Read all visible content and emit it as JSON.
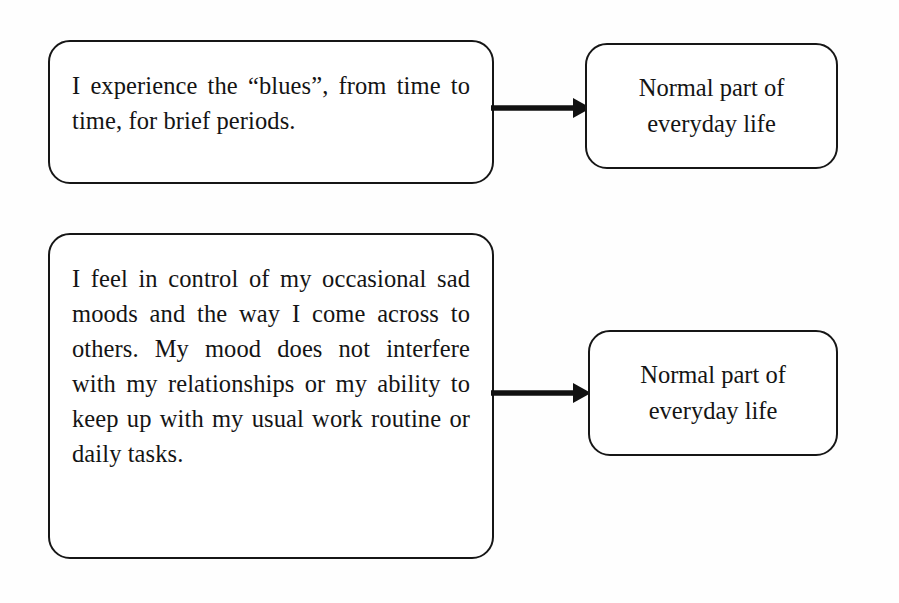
{
  "diagram": {
    "type": "flowchart",
    "background_color": "#fefefe",
    "stroke_color": "#161616",
    "rows": [
      {
        "id": "row-1",
        "statement": "I experience the “blues”, from time to time, for brief periods.",
        "arrow": "arrow-right",
        "outcome": "Normal part of everyday life"
      },
      {
        "id": "row-2",
        "statement": "I feel in control of my occasional sad moods and the way I come across to others. My mood does not interfere with my relationships or my ability to keep up with my usual work routine or daily tasks.",
        "arrow": "arrow-right",
        "outcome": "Normal part of everyday life"
      }
    ]
  }
}
